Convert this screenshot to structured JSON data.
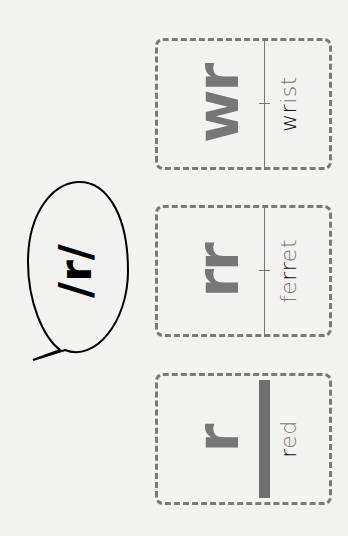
{
  "speech_bubble": {
    "text": "/r/"
  },
  "cards": [
    {
      "spelling": "r",
      "word_highlight": "r",
      "word_rest_before": "",
      "word_rest_after": "ed",
      "word": "red",
      "divider": "thick"
    },
    {
      "spelling": "rr",
      "word_highlight": "rr",
      "word_rest_before": "fe",
      "word_rest_after": "et",
      "word": "ferret",
      "divider": "thin"
    },
    {
      "spelling": "wr",
      "word_highlight": "wr",
      "word_rest_before": "",
      "word_rest_after": "ist",
      "word": "wrist",
      "divider": "thin"
    }
  ],
  "colors": {
    "background": "#f3f3f2",
    "spelling": "#777777",
    "highlight": "#111111",
    "border": "#7a7a7a"
  }
}
